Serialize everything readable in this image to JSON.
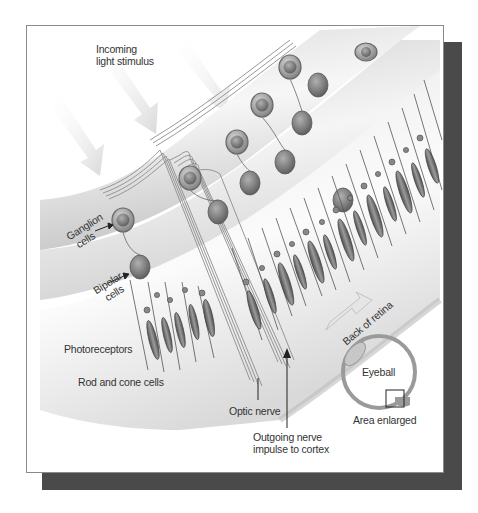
{
  "figure": {
    "labels": {
      "incoming_light": [
        "Incoming",
        "light stimulus"
      ],
      "ganglion": [
        "Ganglion",
        "cells"
      ],
      "bipolar": [
        "Bipolar",
        "cells"
      ],
      "photoreceptors": "Photoreceptors",
      "rods_cones": "Rod and cone cells",
      "back_of_retina": "Back of retina",
      "optic_nerve": "Optic nerve",
      "outgoing": [
        "Outgoing nerve",
        "impulse to cortex"
      ],
      "eyeball": "Eyeball",
      "area_enlarged": "Area enlarged"
    },
    "colors": {
      "shadow": "#4a4a4a",
      "frame_border": "#8a8a8a",
      "band_light": "#f2f2f2",
      "band_dark": "#bdbdbd",
      "cell_fill": "#9a9a9a",
      "cell_stroke": "#555555",
      "rod_fill": "#6e6e6e",
      "nerve_line": "#888888",
      "label_text": "#333333"
    }
  }
}
